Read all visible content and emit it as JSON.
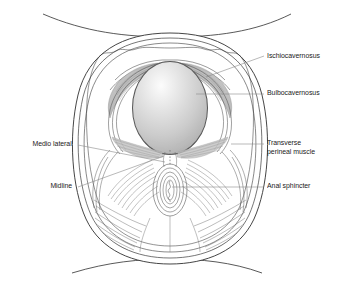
{
  "figure": {
    "background_color": "#ffffff",
    "line_color": "#3b3b3b",
    "muscle_shade_color": "#b8b8b8",
    "leader_color": "#8a8a8a",
    "text_color": "#1a1a1a"
  },
  "labels": {
    "ischiocavernosus": "Ischiocavernosus",
    "bulbocavernosus": "Bulbocavernosus",
    "transverse_perineal_line1": "Transverse",
    "transverse_perineal_line2": "perineal muscle",
    "anal_sphincter": "Anal sphincter",
    "medio_lateral": "Medio lateral",
    "midline": "Midline"
  },
  "structures": {
    "fetal_head": {
      "name": "fetal-head",
      "fill_highlight": "#fbfbfb",
      "fill_mid": "#cfcfcf",
      "fill_edge": "#a9a9a9"
    },
    "anal_sphincter_rings": 5,
    "outline_layers": 4
  },
  "leader_lines": [
    {
      "name": "leader-ischiocavernosus",
      "from": [
        264,
        55
      ],
      "to": [
        205,
        76
      ]
    },
    {
      "name": "leader-bulbocavernosus",
      "from": [
        264,
        93
      ],
      "to": [
        196,
        93
      ]
    },
    {
      "name": "leader-transverse-perineal",
      "from": [
        264,
        143
      ],
      "to": [
        233,
        143
      ]
    },
    {
      "name": "leader-anal-sphincter",
      "from": [
        264,
        186
      ],
      "to": [
        172,
        186
      ]
    },
    {
      "name": "leader-medio-lateral",
      "from": [
        77,
        144
      ],
      "to": [
        164,
        161
      ]
    },
    {
      "name": "leader-midline",
      "from": [
        77,
        186
      ],
      "to": [
        163,
        155
      ]
    }
  ]
}
